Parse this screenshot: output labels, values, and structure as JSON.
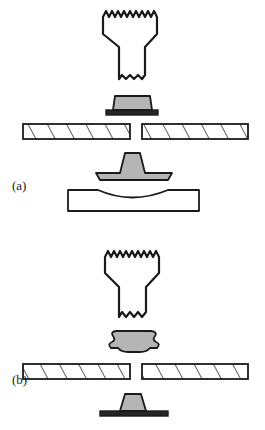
{
  "figure": {
    "width": 265,
    "height": 430,
    "background": "#ffffff",
    "line_color": "#1a1a1a",
    "metal_fill": "#b5b5b5",
    "dark_fill": "#262626",
    "white_fill": "#ffffff"
  },
  "panels": [
    {
      "id": "a",
      "label": "(a)",
      "label_x": 12,
      "label_y": 190,
      "caption_stage": "before forming",
      "components": [
        {
          "name": "horn-tool",
          "description": "tapered horn with jagged broken top edge and scalloped tip"
        },
        {
          "name": "rivet-undeformed",
          "description": "trapezoidal rivet body on dark flange"
        },
        {
          "name": "sheet-left",
          "description": "hatched sheet, left of joint gap"
        },
        {
          "name": "sheet-right",
          "description": "hatched sheet, right of joint gap"
        },
        {
          "name": "die-anvil",
          "description": "mushroom shaped forming die"
        },
        {
          "name": "support-block",
          "description": "block with concave top cavity"
        }
      ]
    },
    {
      "id": "b",
      "label": "(b)",
      "label_x": 12,
      "label_y": 384,
      "caption_stage": "after forming",
      "components": [
        {
          "name": "horn-tool",
          "description": "tapered horn with jagged broken top edge and scalloped tip"
        },
        {
          "name": "rivet-deformed",
          "description": "mushroomed blob shaped rivet head"
        },
        {
          "name": "sheet-left",
          "description": "hatched sheet, left of joint gap"
        },
        {
          "name": "sheet-right",
          "description": "hatched sheet, right of joint gap"
        },
        {
          "name": "anvil-post",
          "description": "tapered post on flat dark base"
        }
      ]
    }
  ]
}
